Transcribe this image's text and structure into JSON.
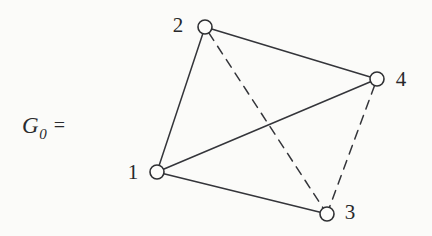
{
  "figure": {
    "name_main": "G",
    "name_subscript": "0",
    "name_equals": "=",
    "background_color": "#fbfbf9",
    "ink_color": "#2a2b2e"
  },
  "graph_data": {
    "type": "node-link-diagram",
    "title": "G0",
    "node_radius": 7,
    "node_fill": "#fdfdfb",
    "node_stroke": "#2f3033",
    "node_stroke_width": 1.6,
    "edge_stroke": "#34353a",
    "edge_stroke_width": 1.5,
    "dash_pattern": "9 7",
    "nodes": [
      {
        "id": "1",
        "label": "1",
        "cx": 157,
        "cy": 172,
        "label_x": 133,
        "label_y": 172
      },
      {
        "id": "2",
        "label": "2",
        "cx": 205,
        "cy": 27,
        "label_x": 178,
        "label_y": 25
      },
      {
        "id": "3",
        "label": "3",
        "cx": 327,
        "cy": 214,
        "label_x": 350,
        "label_y": 212
      },
      {
        "id": "4",
        "label": "4",
        "cx": 377,
        "cy": 79,
        "label_x": 401,
        "label_y": 79
      }
    ],
    "edges": [
      {
        "id": "edge-2-1",
        "source": "2",
        "target": "1",
        "style": "solid"
      },
      {
        "id": "edge-2-4",
        "source": "2",
        "target": "4",
        "style": "solid"
      },
      {
        "id": "edge-1-4",
        "source": "1",
        "target": "4",
        "style": "solid"
      },
      {
        "id": "edge-1-3",
        "source": "1",
        "target": "3",
        "style": "solid"
      },
      {
        "id": "edge-2-3",
        "source": "2",
        "target": "3",
        "style": "dashed"
      },
      {
        "id": "edge-4-3",
        "source": "4",
        "target": "3",
        "style": "dashed"
      }
    ]
  }
}
